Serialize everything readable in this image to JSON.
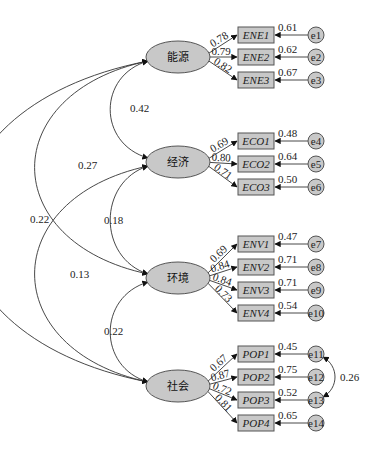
{
  "diagram": {
    "type": "structural-equation-model",
    "colors": {
      "node_fill": "#c8c8c8",
      "node_stroke": "#555555",
      "line": "#333333",
      "background": "#ffffff"
    },
    "latents": [
      {
        "id": "L1",
        "label": "能源",
        "cx": 178,
        "cy": 57
      },
      {
        "id": "L2",
        "label": "经济",
        "cx": 178,
        "cy": 162
      },
      {
        "id": "L3",
        "label": "环境",
        "cx": 178,
        "cy": 278
      },
      {
        "id": "L4",
        "label": "社会",
        "cx": 178,
        "cy": 386
      }
    ],
    "indicators": [
      {
        "latent": "L1",
        "label": "ENE1",
        "loading": "0.78",
        "r2": "0.61",
        "error": "e1",
        "y": 35
      },
      {
        "latent": "L1",
        "label": "ENE2",
        "loading": "0.79",
        "r2": "0.62",
        "error": "e2",
        "y": 57
      },
      {
        "latent": "L1",
        "label": "ENE3",
        "loading": "0.82",
        "r2": "0.67",
        "error": "e3",
        "y": 80
      },
      {
        "latent": "L2",
        "label": "ECO1",
        "loading": "0.69",
        "r2": "0.48",
        "error": "e4",
        "y": 141
      },
      {
        "latent": "L2",
        "label": "ECO2",
        "loading": "0.80",
        "r2": "0.64",
        "error": "e5",
        "y": 164
      },
      {
        "latent": "L2",
        "label": "ECO3",
        "loading": "0.71",
        "r2": "0.50",
        "error": "e6",
        "y": 187
      },
      {
        "latent": "L3",
        "label": "ENV1",
        "loading": "0.69",
        "r2": "0.47",
        "error": "e7",
        "y": 244
      },
      {
        "latent": "L3",
        "label": "ENV2",
        "loading": "0.84",
        "r2": "0.71",
        "error": "e8",
        "y": 267
      },
      {
        "latent": "L3",
        "label": "ENV3",
        "loading": "0.84",
        "r2": "0.71",
        "error": "e9",
        "y": 290
      },
      {
        "latent": "L3",
        "label": "ENV4",
        "loading": "0.73",
        "r2": "0.54",
        "error": "e10",
        "y": 313
      },
      {
        "latent": "L4",
        "label": "POP1",
        "loading": "0.67",
        "r2": "0.45",
        "error": "e11",
        "y": 354
      },
      {
        "latent": "L4",
        "label": "POP2",
        "loading": "0.87",
        "r2": "0.75",
        "error": "e12",
        "y": 377
      },
      {
        "latent": "L4",
        "label": "POP3",
        "loading": "0.72",
        "r2": "0.52",
        "error": "e13",
        "y": 400
      },
      {
        "latent": "L4",
        "label": "POP4",
        "loading": "0.81",
        "r2": "0.65",
        "error": "e14",
        "y": 423
      }
    ],
    "correlations": [
      {
        "from": "L1",
        "to": "L2",
        "value": "0.42"
      },
      {
        "from": "L1",
        "to": "L3",
        "value": "0.27"
      },
      {
        "from": "L1",
        "to": "L4",
        "value": "0.22"
      },
      {
        "from": "L2",
        "to": "L3",
        "value": "0.18"
      },
      {
        "from": "L2",
        "to": "L4",
        "value": "0.13"
      },
      {
        "from": "L3",
        "to": "L4",
        "value": "0.22"
      }
    ],
    "error_covariances": [
      {
        "from": "e11",
        "to": "e13",
        "value": "0.26"
      }
    ]
  }
}
